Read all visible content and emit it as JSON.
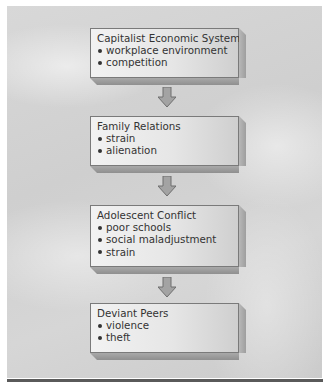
{
  "diagram": {
    "boxes": [
      {
        "title": "Capitalist Economic System",
        "items": [
          "workplace environment",
          "competition"
        ]
      },
      {
        "title": "Family Relations",
        "items": [
          "strain",
          "alienation"
        ]
      },
      {
        "title": "Adolescent Conflict",
        "items": [
          "poor schools",
          "social maladjustment",
          "strain"
        ]
      },
      {
        "title": "Deviant Peers",
        "items": [
          "violence",
          "theft"
        ]
      }
    ],
    "connectors": [
      "down-arrow",
      "down-arrow",
      "down-arrow"
    ],
    "colors": {
      "background": "#d3d3d3",
      "box_face": "#e8e8e8",
      "box_side": "#a8a8a8",
      "arrow": "#a0a0a0",
      "rule": "#5a5a5a"
    }
  }
}
